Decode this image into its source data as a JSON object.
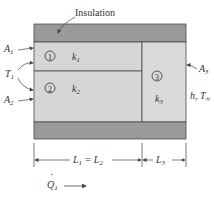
{
  "diagram": {
    "colors": {
      "insulation": "#9a9a9a",
      "layer_fill": "#d6d6d6",
      "layer3_fill": "#d9d9d9",
      "lines": "#4a4a4a",
      "background": "#ffffff"
    },
    "labels": {
      "insulation": "Insulation",
      "A1": "A",
      "A1_sub": "1",
      "T1": "T",
      "T1_sub": "1",
      "A2": "A",
      "A2_sub": "2",
      "A3": "A",
      "A3_sub": "3",
      "layer1_num": "1",
      "layer2_num": "2",
      "layer3_num": "3",
      "k1": "k",
      "k1_sub": "1",
      "k2": "k",
      "k2_sub": "2",
      "k3": "k",
      "k3_sub": "3",
      "conv": "h, T",
      "conv_sub": "∞",
      "L12": "L",
      "L12_sub1": "1",
      "L12_eq": " = L",
      "L12_sub2": "2",
      "L3": "L",
      "L3_sub": "3",
      "Q1": "Q",
      "Q1_sub": "1",
      "Q1_dot": "·"
    }
  }
}
